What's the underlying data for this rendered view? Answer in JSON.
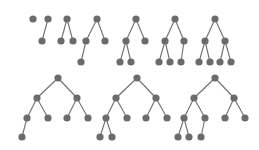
{
  "figure": {
    "background_color": "#ffffff",
    "node_color": "#6b6b6b",
    "edge_color": "#6e6e6e",
    "node_radius": 3.6,
    "edge_width": 1.1,
    "rows": 2,
    "tree_count": 10
  },
  "chart_data": {
    "type": "diagram",
    "xlabel": "",
    "ylabel": "",
    "grid": false,
    "legend": null,
    "node_color": "#6b6b6b",
    "edge_color": "#6e6e6e",
    "node_radius": 3.6,
    "trees": [
      {
        "id": "tree-1",
        "label": "single node",
        "node_count": 1,
        "depth": 1,
        "row": 1,
        "nodes": [
          {
            "id": "n1",
            "x": 33,
            "y": 19
          }
        ],
        "edges": []
      },
      {
        "id": "tree-2",
        "label": "root with one left child",
        "node_count": 2,
        "depth": 2,
        "row": 1,
        "nodes": [
          {
            "id": "n1",
            "x": 48,
            "y": 19
          },
          {
            "id": "n2",
            "x": 42,
            "y": 41
          }
        ],
        "edges": [
          {
            "from": "n1",
            "to": "n2"
          }
        ]
      },
      {
        "id": "tree-3",
        "label": "root with two children",
        "node_count": 3,
        "depth": 2,
        "row": 1,
        "nodes": [
          {
            "id": "n1",
            "x": 67,
            "y": 19
          },
          {
            "id": "n2",
            "x": 61,
            "y": 41
          },
          {
            "id": "n3",
            "x": 73,
            "y": 41
          }
        ],
        "edges": [
          {
            "from": "n1",
            "to": "n2"
          },
          {
            "from": "n1",
            "to": "n3"
          }
        ]
      },
      {
        "id": "tree-4",
        "label": "root with two children, left child has one child",
        "node_count": 4,
        "depth": 3,
        "row": 1,
        "nodes": [
          {
            "id": "n1",
            "x": 97,
            "y": 19
          },
          {
            "id": "n2",
            "x": 86,
            "y": 41
          },
          {
            "id": "n3",
            "x": 105,
            "y": 41
          },
          {
            "id": "n4",
            "x": 81,
            "y": 62
          }
        ],
        "edges": [
          {
            "from": "n1",
            "to": "n2"
          },
          {
            "from": "n1",
            "to": "n3"
          },
          {
            "from": "n2",
            "to": "n4"
          }
        ]
      },
      {
        "id": "tree-5",
        "label": "root with two children, left child has two children",
        "node_count": 5,
        "depth": 3,
        "row": 1,
        "nodes": [
          {
            "id": "n1",
            "x": 136,
            "y": 19
          },
          {
            "id": "n2",
            "x": 126,
            "y": 41
          },
          {
            "id": "n3",
            "x": 145,
            "y": 41
          },
          {
            "id": "n4",
            "x": 120,
            "y": 62
          },
          {
            "id": "n5",
            "x": 131,
            "y": 62
          }
        ],
        "edges": [
          {
            "from": "n1",
            "to": "n2"
          },
          {
            "from": "n1",
            "to": "n3"
          },
          {
            "from": "n2",
            "to": "n4"
          },
          {
            "from": "n2",
            "to": "n5"
          }
        ]
      },
      {
        "id": "tree-6",
        "label": "root with two children, left child has two children, right child has one child",
        "node_count": 6,
        "depth": 3,
        "row": 1,
        "nodes": [
          {
            "id": "n1",
            "x": 175,
            "y": 19
          },
          {
            "id": "n2",
            "x": 165,
            "y": 41
          },
          {
            "id": "n3",
            "x": 184,
            "y": 41
          },
          {
            "id": "n4",
            "x": 159,
            "y": 62
          },
          {
            "id": "n5",
            "x": 170,
            "y": 62
          },
          {
            "id": "n6",
            "x": 181,
            "y": 62
          }
        ],
        "edges": [
          {
            "from": "n1",
            "to": "n2"
          },
          {
            "from": "n1",
            "to": "n3"
          },
          {
            "from": "n2",
            "to": "n4"
          },
          {
            "from": "n2",
            "to": "n5"
          },
          {
            "from": "n3",
            "to": "n6"
          }
        ]
      },
      {
        "id": "tree-7",
        "label": "complete binary tree of depth three",
        "node_count": 7,
        "depth": 3,
        "row": 1,
        "nodes": [
          {
            "id": "n1",
            "x": 215,
            "y": 19
          },
          {
            "id": "n2",
            "x": 205,
            "y": 41
          },
          {
            "id": "n3",
            "x": 225,
            "y": 41
          },
          {
            "id": "n4",
            "x": 199,
            "y": 62
          },
          {
            "id": "n5",
            "x": 210,
            "y": 62
          },
          {
            "id": "n6",
            "x": 220,
            "y": 62
          },
          {
            "id": "n7",
            "x": 231,
            "y": 62
          }
        ],
        "edges": [
          {
            "from": "n1",
            "to": "n2"
          },
          {
            "from": "n1",
            "to": "n3"
          },
          {
            "from": "n2",
            "to": "n4"
          },
          {
            "from": "n2",
            "to": "n5"
          },
          {
            "from": "n3",
            "to": "n6"
          },
          {
            "from": "n3",
            "to": "n7"
          }
        ]
      },
      {
        "id": "tree-8",
        "label": "balanced tree of depth three with one extra node on the far left",
        "node_count": 8,
        "depth": 4,
        "row": 2,
        "nodes": [
          {
            "id": "n1",
            "x": 58,
            "y": 78
          },
          {
            "id": "n2",
            "x": 37,
            "y": 98
          },
          {
            "id": "n3",
            "x": 77,
            "y": 98
          },
          {
            "id": "n4",
            "x": 27,
            "y": 118
          },
          {
            "id": "n5",
            "x": 48,
            "y": 118
          },
          {
            "id": "n6",
            "x": 67,
            "y": 118
          },
          {
            "id": "n7",
            "x": 88,
            "y": 118
          },
          {
            "id": "n8",
            "x": 22,
            "y": 137
          }
        ],
        "edges": [
          {
            "from": "n1",
            "to": "n2"
          },
          {
            "from": "n1",
            "to": "n3"
          },
          {
            "from": "n2",
            "to": "n4"
          },
          {
            "from": "n2",
            "to": "n5"
          },
          {
            "from": "n3",
            "to": "n6"
          },
          {
            "from": "n3",
            "to": "n7"
          },
          {
            "from": "n4",
            "to": "n8"
          }
        ]
      },
      {
        "id": "tree-9",
        "label": "balanced tree of depth three with two extra nodes under the far-left leaf",
        "node_count": 9,
        "depth": 4,
        "row": 2,
        "nodes": [
          {
            "id": "n1",
            "x": 137,
            "y": 78
          },
          {
            "id": "n2",
            "x": 116,
            "y": 98
          },
          {
            "id": "n3",
            "x": 156,
            "y": 98
          },
          {
            "id": "n4",
            "x": 106,
            "y": 118
          },
          {
            "id": "n5",
            "x": 127,
            "y": 118
          },
          {
            "id": "n6",
            "x": 146,
            "y": 118
          },
          {
            "id": "n7",
            "x": 167,
            "y": 118
          },
          {
            "id": "n8",
            "x": 100,
            "y": 137
          },
          {
            "id": "n9",
            "x": 112,
            "y": 137
          }
        ],
        "edges": [
          {
            "from": "n1",
            "to": "n2"
          },
          {
            "from": "n1",
            "to": "n3"
          },
          {
            "from": "n2",
            "to": "n4"
          },
          {
            "from": "n2",
            "to": "n5"
          },
          {
            "from": "n3",
            "to": "n6"
          },
          {
            "from": "n3",
            "to": "n7"
          },
          {
            "from": "n4",
            "to": "n8"
          },
          {
            "from": "n4",
            "to": "n9"
          }
        ]
      },
      {
        "id": "tree-10",
        "label": "tree of depth four with three leaves under the left subtree",
        "node_count": 10,
        "depth": 4,
        "row": 2,
        "nodes": [
          {
            "id": "n1",
            "x": 215,
            "y": 78
          },
          {
            "id": "n2",
            "x": 194,
            "y": 98
          },
          {
            "id": "n3",
            "x": 234,
            "y": 98
          },
          {
            "id": "n4",
            "x": 184,
            "y": 118
          },
          {
            "id": "n5",
            "x": 205,
            "y": 118
          },
          {
            "id": "n6",
            "x": 225,
            "y": 118
          },
          {
            "id": "n7",
            "x": 245,
            "y": 118
          },
          {
            "id": "n8",
            "x": 178,
            "y": 137
          },
          {
            "id": "n9",
            "x": 189,
            "y": 137
          },
          {
            "id": "n10",
            "x": 201,
            "y": 137
          }
        ],
        "edges": [
          {
            "from": "n1",
            "to": "n2"
          },
          {
            "from": "n1",
            "to": "n3"
          },
          {
            "from": "n2",
            "to": "n4"
          },
          {
            "from": "n2",
            "to": "n5"
          },
          {
            "from": "n3",
            "to": "n6"
          },
          {
            "from": "n3",
            "to": "n7"
          },
          {
            "from": "n4",
            "to": "n8"
          },
          {
            "from": "n4",
            "to": "n9"
          },
          {
            "from": "n5",
            "to": "n10"
          }
        ]
      }
    ]
  }
}
